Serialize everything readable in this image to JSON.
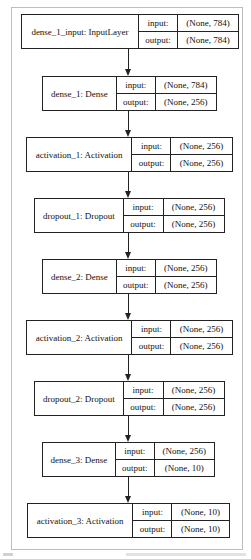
{
  "diagram": {
    "type": "keras-model-plot",
    "io_labels": {
      "input": "input:",
      "output": "output:"
    },
    "nodes": [
      {
        "name": "dense_1_input: InputLayer",
        "input": "(None, 784)",
        "output": "(None, 784)"
      },
      {
        "name": "dense_1: Dense",
        "input": "(None, 784)",
        "output": "(None, 256)"
      },
      {
        "name": "activation_1: Activation",
        "input": "(None, 256)",
        "output": "(None, 256)"
      },
      {
        "name": "dropout_1: Dropout",
        "input": "(None, 256)",
        "output": "(None, 256)"
      },
      {
        "name": "dense_2: Dense",
        "input": "(None, 256)",
        "output": "(None, 256)"
      },
      {
        "name": "activation_2: Activation",
        "input": "(None, 256)",
        "output": "(None, 256)"
      },
      {
        "name": "dropout_2: Dropout",
        "input": "(None, 256)",
        "output": "(None, 256)"
      },
      {
        "name": "dense_3: Dense",
        "input": "(None, 256)",
        "output": "(None, 10)"
      },
      {
        "name": "activation_3: Activation",
        "input": "(None, 10)",
        "output": "(None, 10)"
      }
    ],
    "edges": [
      [
        0,
        1
      ],
      [
        1,
        2
      ],
      [
        2,
        3
      ],
      [
        3,
        4
      ],
      [
        4,
        5
      ],
      [
        5,
        6
      ],
      [
        6,
        7
      ],
      [
        7,
        8
      ]
    ]
  },
  "colors": {
    "border": "#222222",
    "frame": "#bdbdbd",
    "background": "#ffffff"
  }
}
